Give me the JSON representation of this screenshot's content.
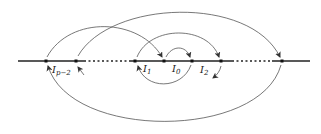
{
  "diagram": {
    "type": "interval-map-arrows",
    "colors": {
      "line": "#222222",
      "arc": "#555555",
      "dot": "#111111",
      "background": "#ffffff"
    },
    "axis": {
      "x_start": 18,
      "x_end": 310,
      "y": 61
    },
    "points_x": [
      46,
      76,
      135,
      164,
      192,
      221,
      282
    ],
    "dotted_gaps": [
      [
        82,
        130
      ],
      [
        230,
        275
      ]
    ],
    "labels": [
      {
        "id": "I_p-2",
        "base": "I",
        "sub": "p−2",
        "x": 50,
        "y": 73
      },
      {
        "id": "I_1",
        "base": "I",
        "sub": "1",
        "x": 143,
        "y": 72
      },
      {
        "id": "I_0",
        "base": "I",
        "sub": "0",
        "x": 172,
        "y": 72
      },
      {
        "id": "I_2",
        "base": "I",
        "sub": "2",
        "x": 200,
        "y": 73
      }
    ]
  }
}
